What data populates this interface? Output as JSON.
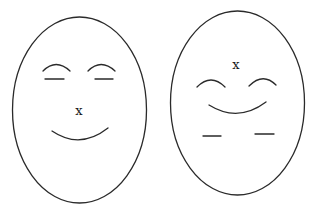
{
  "diagram": {
    "faces": [
      {
        "id": "left-face",
        "nose_marker": "x",
        "features": [
          "two eyebrow arcs above closed-eye dashes",
          "x marker at center",
          "smile arc below"
        ]
      },
      {
        "id": "right-face",
        "nose_marker": "x",
        "features": [
          "x marker near top",
          "two eyebrow arcs",
          "smile arc",
          "two dashes near bottom"
        ]
      }
    ],
    "colors": {
      "stroke": "#2a2a2a",
      "background": "#ffffff"
    }
  }
}
